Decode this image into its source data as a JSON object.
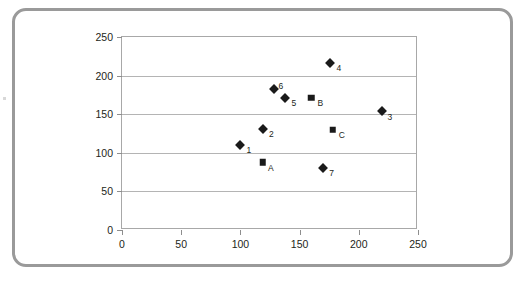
{
  "chart_data": {
    "type": "scatter",
    "title": "",
    "subtitle": "",
    "xlabel": "",
    "ylabel": "",
    "xlim": [
      0,
      250
    ],
    "ylim": [
      0,
      250
    ],
    "xticks": [
      0,
      50,
      100,
      150,
      200,
      250
    ],
    "yticks": [
      0,
      50,
      100,
      150,
      200,
      250
    ],
    "xtick_labels": [
      "0",
      "50",
      "100",
      "150",
      "200",
      "250"
    ],
    "ytick_labels": [
      "0",
      "50",
      "100",
      "150",
      "200",
      "250"
    ],
    "grid": "horizontal",
    "legend": "none",
    "series": [
      {
        "name": "numbered-points",
        "marker": "diamond",
        "color": "#1a1a1a",
        "points": [
          {
            "label": "1",
            "x": 100,
            "y": 110,
            "label_pos": "right"
          },
          {
            "label": "2",
            "x": 119,
            "y": 131,
            "label_pos": "right"
          },
          {
            "label": "3",
            "x": 220,
            "y": 154,
            "label_pos": "downright"
          },
          {
            "label": "4",
            "x": 176,
            "y": 216,
            "label_pos": "right"
          },
          {
            "label": "5",
            "x": 138,
            "y": 171,
            "label_pos": "right"
          },
          {
            "label": "6",
            "x": 128,
            "y": 183,
            "label_pos": "upright"
          },
          {
            "label": "7",
            "x": 170,
            "y": 80,
            "label_pos": "right"
          }
        ]
      },
      {
        "name": "lettered-points",
        "marker": "square",
        "color": "#1a1a1a",
        "points": [
          {
            "label": "A",
            "x": 119,
            "y": 88,
            "label_pos": "downright"
          },
          {
            "label": "B",
            "x": 160,
            "y": 171,
            "label_pos": "right"
          },
          {
            "label": "C",
            "x": 178,
            "y": 130,
            "label_pos": "right"
          }
        ]
      }
    ]
  },
  "colors": {
    "frame_border": "#9a9a9a",
    "plot_border": "#a8a8a8",
    "gridline": "#b4b4b4",
    "marker": "#1a1a1a",
    "text": "#231f20",
    "background": "#ffffff"
  }
}
